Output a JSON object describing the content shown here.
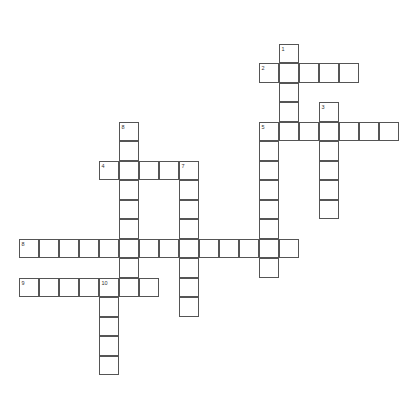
{
  "puzzle": {
    "type": "crossword",
    "origin": {
      "x": 19,
      "y": 44
    },
    "cell_width": 20,
    "cell_height": 19.5,
    "colors": {
      "border": "#555555",
      "fill": "#ffffff",
      "number": "#333333"
    },
    "words": [
      {
        "number": "1",
        "direction": "down",
        "row": 0,
        "col": 13,
        "length": 5
      },
      {
        "number": "2",
        "direction": "across",
        "row": 1,
        "col": 12,
        "length": 5
      },
      {
        "number": "3",
        "direction": "down",
        "row": 3,
        "col": 15,
        "length": 6
      },
      {
        "number": "4",
        "direction": "across",
        "row": 6,
        "col": 4,
        "length": 5
      },
      {
        "number": "5",
        "direction": "across",
        "row": 4,
        "col": 12,
        "length": 7
      },
      {
        "number": "5",
        "direction": "down",
        "row": 4,
        "col": 12,
        "length": 8
      },
      {
        "number": "7",
        "direction": "down",
        "row": 6,
        "col": 8,
        "length": 8
      },
      {
        "number": "8",
        "direction": "down",
        "row": 4,
        "col": 5,
        "length": 9
      },
      {
        "number": "8",
        "direction": "across",
        "row": 10,
        "col": 0,
        "length": 14
      },
      {
        "number": "9",
        "direction": "across",
        "row": 12,
        "col": 0,
        "length": 7
      },
      {
        "number": "10",
        "direction": "down",
        "row": 12,
        "col": 4,
        "length": 5
      }
    ]
  }
}
